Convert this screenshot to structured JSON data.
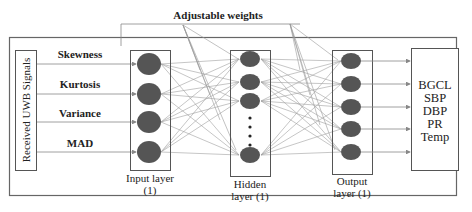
{
  "title": "Adjustable weights",
  "signal_source": "Received UWB Signals",
  "features": [
    {
      "label": "Skewness",
      "y": 64
    },
    {
      "label": "Kurtosis",
      "y": 94
    },
    {
      "label": "Variance",
      "y": 122
    },
    {
      "label": "MAD",
      "y": 152
    }
  ],
  "layers": {
    "input": {
      "label_line1": "Input layer",
      "label_line2": "(1)",
      "node_count": 4
    },
    "hidden": {
      "label_line1": "Hidden",
      "label_line2": "layer (1)",
      "visible_nodes": 4,
      "ellipsis": "⋮"
    },
    "output": {
      "label_line1": "Output",
      "label_line2": "layer (1)",
      "node_count": 5
    }
  },
  "outputs": [
    "BGCL",
    "SBP",
    "DBP",
    "PR",
    "Temp"
  ],
  "colors": {
    "node_fill": "#555555",
    "line": "#9a9a9a",
    "box_stroke": "#555555",
    "text": "#222222"
  }
}
